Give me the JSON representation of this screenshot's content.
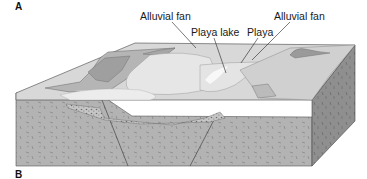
{
  "figure": {
    "panel_top_label": "A",
    "panel_bottom_label": "B",
    "callouts": [
      {
        "id": "alluvial-fan-left",
        "label": "Alluvial fan"
      },
      {
        "id": "playa-lake",
        "label": "Playa lake"
      },
      {
        "id": "playa",
        "label": "Playa"
      },
      {
        "id": "alluvial-fan-right",
        "label": "Alluvial fan"
      }
    ]
  },
  "colors": {
    "top_surface": "#d4d4d4",
    "mountain_dark": "#9e9e9e",
    "mountain_mid": "#b8b8b8",
    "basin_light": "#e8e8e8",
    "front_face": "#b3b3b3",
    "side_face": "#8f8f8f",
    "outline": "#333333"
  }
}
